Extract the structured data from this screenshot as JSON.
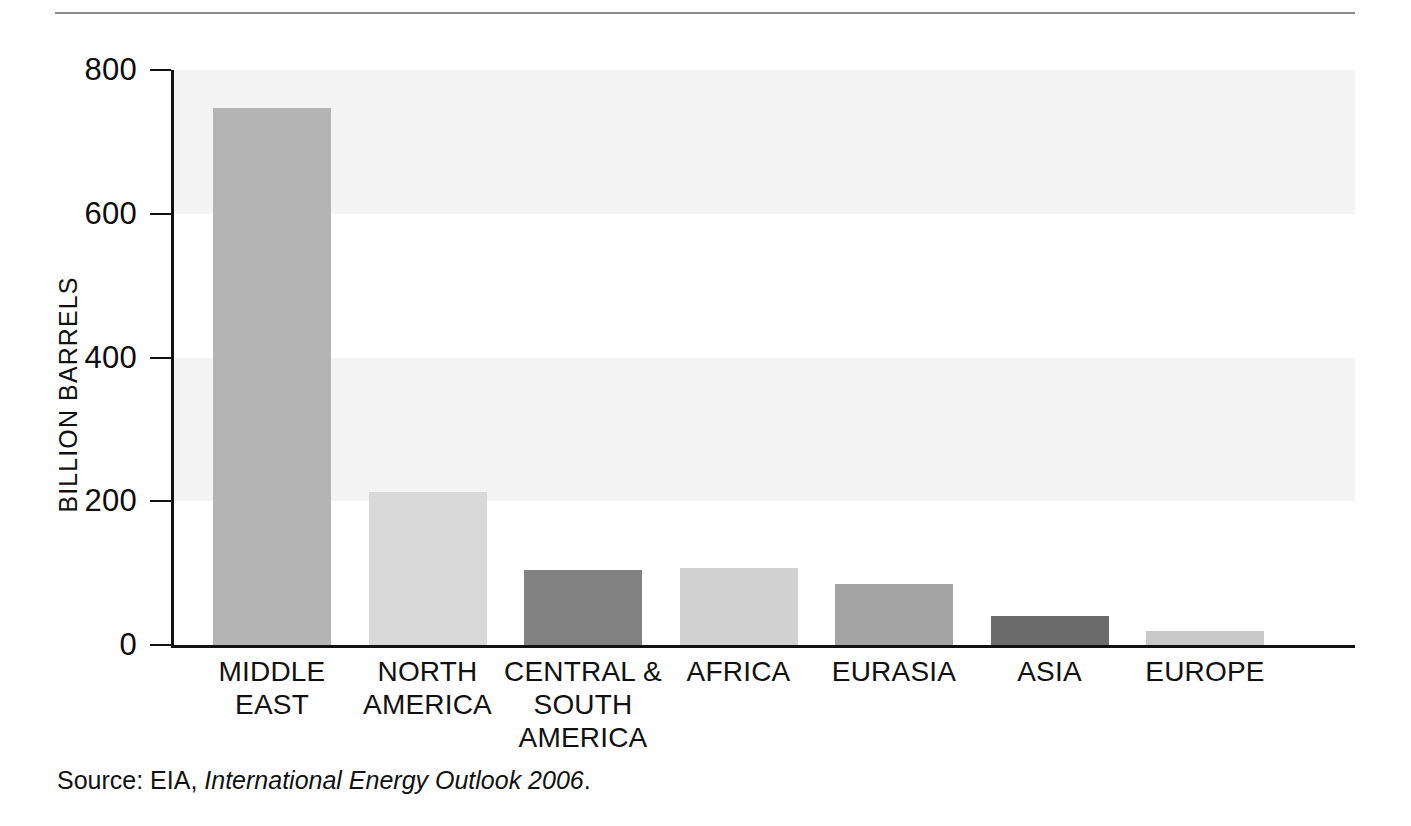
{
  "chart_data": {
    "type": "bar",
    "title": "",
    "xlabel": "",
    "ylabel": "BILLION BARRELS",
    "ylim": [
      0,
      800
    ],
    "yticks": [
      0,
      200,
      400,
      600,
      800
    ],
    "ytick_labels": [
      "0",
      "200",
      "400",
      "600",
      "800"
    ],
    "grid": false,
    "legend": "none",
    "banded_background": true,
    "categories": [
      "MIDDLE EAST",
      "NORTH AMERICA",
      "CENTRAL & SOUTH AMERICA",
      "AFRICA",
      "EURASIA",
      "ASIA",
      "EUROPE"
    ],
    "values": [
      747,
      213,
      105,
      107,
      85,
      40,
      20
    ],
    "bar_colors": [
      "#b4b4b4",
      "#d9d9d9",
      "#828282",
      "#d2d2d2",
      "#a3a3a3",
      "#6b6b6b",
      "#c9c9c9"
    ]
  },
  "axis": {
    "y_title": "BILLION BARRELS",
    "ticks": [
      {
        "value": 800,
        "label": "800"
      },
      {
        "value": 600,
        "label": "600"
      },
      {
        "value": 400,
        "label": "400"
      },
      {
        "value": 200,
        "label": "200"
      },
      {
        "value": 0,
        "label": "0"
      }
    ]
  },
  "categories": [
    {
      "label_lines": [
        "MIDDLE",
        "EAST"
      ],
      "value": 747,
      "color": "#b4b4b4"
    },
    {
      "label_lines": [
        "NORTH",
        "AMERICA"
      ],
      "value": 213,
      "color": "#d9d9d9"
    },
    {
      "label_lines": [
        "CENTRAL &",
        "SOUTH",
        "AMERICA"
      ],
      "value": 105,
      "color": "#828282"
    },
    {
      "label_lines": [
        "AFRICA"
      ],
      "value": 107,
      "color": "#d2d2d2"
    },
    {
      "label_lines": [
        "EURASIA"
      ],
      "value": 85,
      "color": "#a3a3a3"
    },
    {
      "label_lines": [
        "ASIA"
      ],
      "value": 40,
      "color": "#6b6b6b"
    },
    {
      "label_lines": [
        "EUROPE"
      ],
      "value": 20,
      "color": "#c9c9c9"
    }
  ],
  "source": {
    "prefix": "Source: EIA, ",
    "publication": "International Energy Outlook 2006",
    "suffix": "."
  },
  "colors": {
    "band": "#f4f4f4",
    "axis": "#121212",
    "rule": "#8c8c8c",
    "text": "#111111",
    "background": "#ffffff"
  }
}
